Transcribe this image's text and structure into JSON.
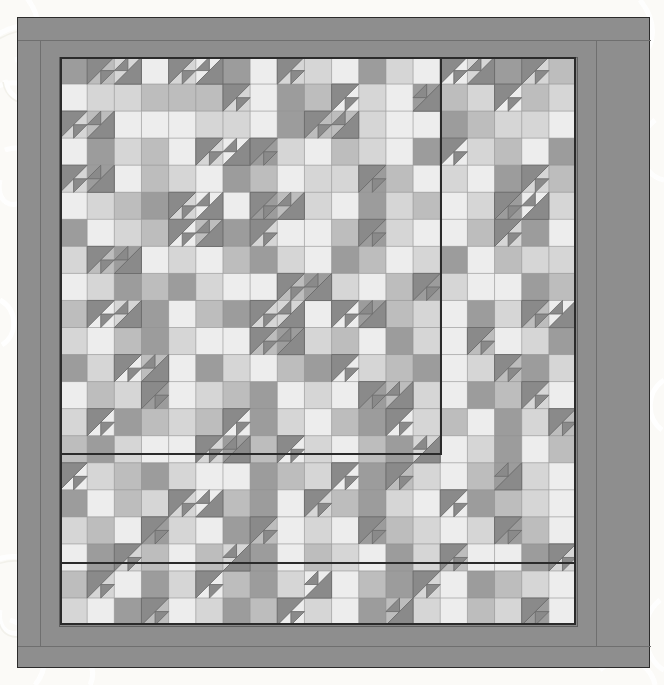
{
  "artwork": {
    "title": "Quilt Block Layout",
    "type": "pieced-quilt-diagram",
    "background_color": "#fdfdfb",
    "frame": {
      "outer_border_color": "#8e8e8e",
      "inner_border_color": "#878787",
      "outline_color": "#2b2b2b",
      "seam_color": "#6f6f6f",
      "outer_rect": [
        17,
        17,
        633,
        651
      ],
      "inner_rect": [
        41,
        39,
        519,
        570
      ]
    },
    "field": {
      "rect": [
        60,
        57,
        516,
        568
      ],
      "cols": 19,
      "rows": 21,
      "cell_w": 27.16,
      "cell_h": 27.05,
      "seam_color": "#8f8f8f",
      "section_line_color": "#2b2b2b"
    },
    "palette": {
      "dark": "#9c9c9c",
      "medium": "#bdbdbd",
      "light": "#d6d6d6",
      "white": "#ededed",
      "triangle_dark": "#8a8a8a",
      "triangle_outline": "#6a6a6a"
    },
    "section_lines": [
      {
        "name": "upper-right-block-left-edge",
        "x1": 381,
        "y1": 0,
        "x2": 381,
        "y2": 397
      },
      {
        "name": "upper-left-block-bottom-edge",
        "x1": 0,
        "y1": 397,
        "x2": 381,
        "y2": 397
      },
      {
        "name": "lower-block-top-edge",
        "x1": 0,
        "y1": 506,
        "x2": 516,
        "y2": 506
      }
    ],
    "grid": [
      "dmlwlwdwllwdlwwldlm",
      "wllmmmlwdmwlwdmlwml",
      "lmwwwllwdmmlwwdmllw",
      "wdlmwlwdlwmlwdwlmwd",
      "ldwmlwdmwlldmwlwdlm",
      "wlmdlwwdmlwdlmwldwl",
      "dwlmwmdlwwmdlwwmldw",
      "lmdwlwmdlwdmwldwmll",
      "wldmdlwwmdlwmdlwwdm",
      "mwldwmdllwwdmlwdlmw",
      "lwmdlwwmdlmwdlwmwld",
      "dlwmwdlwmdwlmdwlmdl",
      "wmldwlmdwlwdmlwdmlw",
      "lwdmlmwdlwmdwlmwdlm",
      "mdlwwldmwlwmdlwldwm",
      "wlmdlwwdmlwdmlwmdlw",
      "dwmllwmdwlmdlwwdmlw",
      "lmwdlwdmwlwdmlwldmw",
      "wdlmwmldwmlwdlmwwdl",
      "mlwdlwmdlwwmdlwdmlw",
      "lwdmwldmwlwdmlwmldw"
    ],
    "triangles": [
      {
        "r": 0,
        "c": 1,
        "dir": "tl"
      },
      {
        "r": 0,
        "c": 2,
        "dir": "br"
      },
      {
        "r": 0,
        "c": 4,
        "dir": "tl"
      },
      {
        "r": 0,
        "c": 5,
        "dir": "br"
      },
      {
        "r": 0,
        "c": 8,
        "dir": "tl"
      },
      {
        "r": 0,
        "c": 14,
        "dir": "tl"
      },
      {
        "r": 0,
        "c": 15,
        "dir": "br"
      },
      {
        "r": 0,
        "c": 17,
        "dir": "tl"
      },
      {
        "r": 1,
        "c": 6,
        "dir": "tl"
      },
      {
        "r": 1,
        "c": 10,
        "dir": "tl"
      },
      {
        "r": 1,
        "c": 13,
        "dir": "br"
      },
      {
        "r": 1,
        "c": 16,
        "dir": "tl"
      },
      {
        "r": 2,
        "c": 0,
        "dir": "tl"
      },
      {
        "r": 2,
        "c": 1,
        "dir": "br"
      },
      {
        "r": 2,
        "c": 9,
        "dir": "tl"
      },
      {
        "r": 2,
        "c": 10,
        "dir": "br"
      },
      {
        "r": 3,
        "c": 5,
        "dir": "tl"
      },
      {
        "r": 3,
        "c": 6,
        "dir": "br"
      },
      {
        "r": 3,
        "c": 7,
        "dir": "tl"
      },
      {
        "r": 3,
        "c": 14,
        "dir": "tl"
      },
      {
        "r": 4,
        "c": 0,
        "dir": "tl"
      },
      {
        "r": 4,
        "c": 1,
        "dir": "br"
      },
      {
        "r": 4,
        "c": 11,
        "dir": "tl"
      },
      {
        "r": 4,
        "c": 17,
        "dir": "tl"
      },
      {
        "r": 5,
        "c": 4,
        "dir": "tl"
      },
      {
        "r": 5,
        "c": 5,
        "dir": "br"
      },
      {
        "r": 5,
        "c": 7,
        "dir": "tl"
      },
      {
        "r": 5,
        "c": 8,
        "dir": "br"
      },
      {
        "r": 5,
        "c": 16,
        "dir": "tl"
      },
      {
        "r": 5,
        "c": 17,
        "dir": "br"
      },
      {
        "r": 6,
        "c": 4,
        "dir": "tl"
      },
      {
        "r": 6,
        "c": 5,
        "dir": "br"
      },
      {
        "r": 6,
        "c": 7,
        "dir": "tl"
      },
      {
        "r": 6,
        "c": 11,
        "dir": "tl"
      },
      {
        "r": 6,
        "c": 16,
        "dir": "tl"
      },
      {
        "r": 7,
        "c": 1,
        "dir": "tl"
      },
      {
        "r": 7,
        "c": 2,
        "dir": "br"
      },
      {
        "r": 8,
        "c": 8,
        "dir": "tl"
      },
      {
        "r": 8,
        "c": 9,
        "dir": "br"
      },
      {
        "r": 8,
        "c": 13,
        "dir": "tl"
      },
      {
        "r": 9,
        "c": 1,
        "dir": "tl"
      },
      {
        "r": 9,
        "c": 2,
        "dir": "br"
      },
      {
        "r": 9,
        "c": 7,
        "dir": "tl"
      },
      {
        "r": 9,
        "c": 8,
        "dir": "br"
      },
      {
        "r": 9,
        "c": 10,
        "dir": "tl"
      },
      {
        "r": 9,
        "c": 11,
        "dir": "br"
      },
      {
        "r": 9,
        "c": 17,
        "dir": "tl"
      },
      {
        "r": 9,
        "c": 18,
        "dir": "br"
      },
      {
        "r": 10,
        "c": 7,
        "dir": "tl"
      },
      {
        "r": 10,
        "c": 8,
        "dir": "br"
      },
      {
        "r": 10,
        "c": 15,
        "dir": "tl"
      },
      {
        "r": 11,
        "c": 2,
        "dir": "tl"
      },
      {
        "r": 11,
        "c": 3,
        "dir": "br"
      },
      {
        "r": 11,
        "c": 10,
        "dir": "tl"
      },
      {
        "r": 11,
        "c": 16,
        "dir": "tl"
      },
      {
        "r": 12,
        "c": 3,
        "dir": "tl"
      },
      {
        "r": 12,
        "c": 11,
        "dir": "tl"
      },
      {
        "r": 12,
        "c": 12,
        "dir": "br"
      },
      {
        "r": 12,
        "c": 17,
        "dir": "tl"
      },
      {
        "r": 13,
        "c": 1,
        "dir": "tl"
      },
      {
        "r": 13,
        "c": 6,
        "dir": "tl"
      },
      {
        "r": 13,
        "c": 12,
        "dir": "tl"
      },
      {
        "r": 13,
        "c": 18,
        "dir": "tl"
      },
      {
        "r": 14,
        "c": 5,
        "dir": "tl"
      },
      {
        "r": 14,
        "c": 6,
        "dir": "br"
      },
      {
        "r": 14,
        "c": 8,
        "dir": "tl"
      },
      {
        "r": 14,
        "c": 13,
        "dir": "br"
      },
      {
        "r": 15,
        "c": 0,
        "dir": "tl"
      },
      {
        "r": 15,
        "c": 10,
        "dir": "tl"
      },
      {
        "r": 15,
        "c": 12,
        "dir": "tl"
      },
      {
        "r": 15,
        "c": 16,
        "dir": "br"
      },
      {
        "r": 16,
        "c": 4,
        "dir": "tl"
      },
      {
        "r": 16,
        "c": 5,
        "dir": "br"
      },
      {
        "r": 16,
        "c": 9,
        "dir": "tl"
      },
      {
        "r": 16,
        "c": 14,
        "dir": "tl"
      },
      {
        "r": 17,
        "c": 3,
        "dir": "tl"
      },
      {
        "r": 17,
        "c": 7,
        "dir": "tl"
      },
      {
        "r": 17,
        "c": 11,
        "dir": "tl"
      },
      {
        "r": 17,
        "c": 16,
        "dir": "tl"
      },
      {
        "r": 18,
        "c": 2,
        "dir": "tl"
      },
      {
        "r": 18,
        "c": 6,
        "dir": "br"
      },
      {
        "r": 18,
        "c": 14,
        "dir": "tl"
      },
      {
        "r": 18,
        "c": 18,
        "dir": "tl"
      },
      {
        "r": 19,
        "c": 1,
        "dir": "tl"
      },
      {
        "r": 19,
        "c": 5,
        "dir": "tl"
      },
      {
        "r": 19,
        "c": 9,
        "dir": "br"
      },
      {
        "r": 19,
        "c": 13,
        "dir": "tl"
      },
      {
        "r": 20,
        "c": 3,
        "dir": "tl"
      },
      {
        "r": 20,
        "c": 8,
        "dir": "tl"
      },
      {
        "r": 20,
        "c": 12,
        "dir": "br"
      },
      {
        "r": 20,
        "c": 17,
        "dir": "tl"
      }
    ]
  }
}
